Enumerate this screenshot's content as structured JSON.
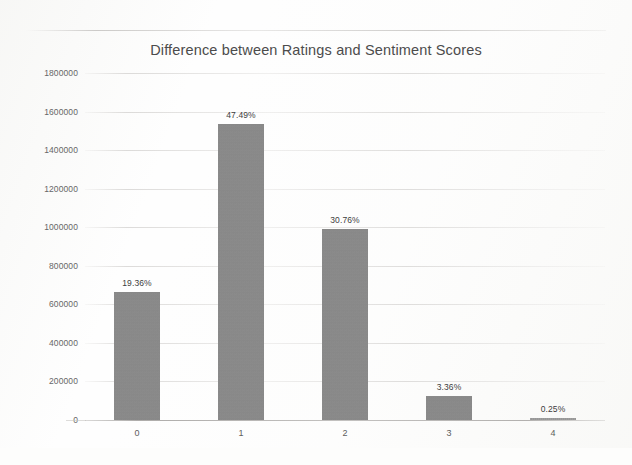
{
  "chart_data": {
    "type": "bar",
    "title": "Difference between Ratings and Sentiment Scores",
    "xlabel": "",
    "ylabel": "",
    "categories": [
      "0",
      "1",
      "2",
      "3",
      "4"
    ],
    "values": [
      663000,
      1534000,
      990000,
      124000,
      8000
    ],
    "data_labels": [
      "19.36%",
      "47.49%",
      "30.76%",
      "3.36%",
      "0.25%"
    ],
    "percentages": [
      19.36,
      47.49,
      30.76,
      3.36,
      0.25
    ],
    "ylim": [
      0,
      1800000
    ],
    "ytick_step": 200000,
    "ytick_labels": [
      "1800000",
      "1600000",
      "1400000",
      "1200000",
      "1000000",
      "800000",
      "600000",
      "400000",
      "200000",
      "0"
    ],
    "grid": true,
    "grid_axis": "y",
    "legend": false,
    "legend_position": "none",
    "bar_color": "#8a8a8a",
    "title_color": "#4c4c4c",
    "tick_color": "#676767",
    "gridline_color": "#d0cecc",
    "background_color": "#fefefe"
  }
}
